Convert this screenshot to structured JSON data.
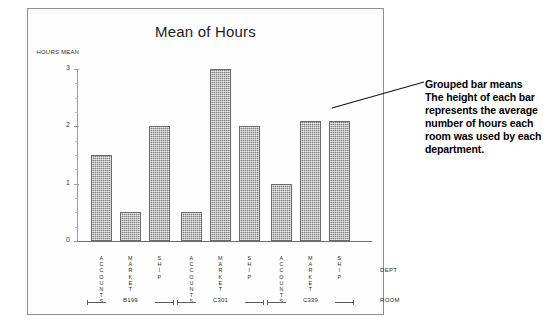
{
  "chart_data": {
    "type": "bar",
    "title": "Mean of Hours",
    "ylabel": "HOURS MEAN",
    "xlabel": "DEPT",
    "grouplabel": "ROOM",
    "ylim": [
      0,
      3
    ],
    "yticks": [
      "0",
      "1",
      "2",
      "3"
    ],
    "grid": false,
    "legend": "none",
    "categories": [
      "ACCOUNTS",
      "MARKET",
      "SHIP"
    ],
    "groups": [
      {
        "room": "B199",
        "values": [
          1.5,
          0.5,
          2.0
        ]
      },
      {
        "room": "C301",
        "values": [
          0.5,
          3.0,
          2.0
        ]
      },
      {
        "room": "C339",
        "values": [
          1.0,
          2.1,
          2.1
        ]
      }
    ],
    "bar_color": "#a0a0a0"
  },
  "annotation": {
    "heading": "Grouped bar means",
    "body": "The height of each bar represents the average number of hours each room was used by each department."
  }
}
